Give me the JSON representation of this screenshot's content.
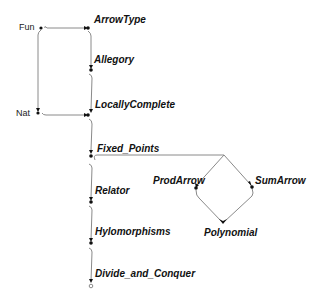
{
  "diagram": {
    "type": "dependency-graph",
    "sources": [
      {
        "id": "fun",
        "label": "Fun"
      },
      {
        "id": "nat",
        "label": "Nat"
      }
    ],
    "nodes": [
      {
        "id": "arrowtype",
        "label": "ArrowType"
      },
      {
        "id": "allegory",
        "label": "Allegory"
      },
      {
        "id": "locallycomplete",
        "label": "LocallyComplete"
      },
      {
        "id": "fixed_points",
        "label": "Fixed_Points"
      },
      {
        "id": "relator",
        "label": "Relator"
      },
      {
        "id": "hylomorphisms",
        "label": "Hylomorphisms"
      },
      {
        "id": "divide_and_conquer",
        "label": "Divide_and_Conquer"
      },
      {
        "id": "prodarrow",
        "label": "ProdArrow"
      },
      {
        "id": "sumarrow",
        "label": "SumArrow"
      },
      {
        "id": "polynomial",
        "label": "Polynomial"
      }
    ],
    "edges": [
      {
        "from": "Fun",
        "to": "ArrowType"
      },
      {
        "from": "Fun",
        "to": "Nat"
      },
      {
        "from": "ArrowType",
        "to": "Allegory"
      },
      {
        "from": "Allegory",
        "to": "LocallyComplete"
      },
      {
        "from": "Nat",
        "to": "LocallyComplete"
      },
      {
        "from": "LocallyComplete",
        "to": "Fixed_Points"
      },
      {
        "from": "Fixed_Points",
        "to": "Relator"
      },
      {
        "from": "Fixed_Points",
        "to": "ProdArrow"
      },
      {
        "from": "Fixed_Points",
        "to": "SumArrow"
      },
      {
        "from": "ProdArrow",
        "to": "Polynomial"
      },
      {
        "from": "SumArrow",
        "to": "Polynomial"
      },
      {
        "from": "Relator",
        "to": "Hylomorphisms"
      },
      {
        "from": "Hylomorphisms",
        "to": "Divide_and_Conquer"
      }
    ],
    "colors": {
      "edge": "#8a8a8a",
      "dot": "#111111",
      "text": "#111111"
    }
  }
}
